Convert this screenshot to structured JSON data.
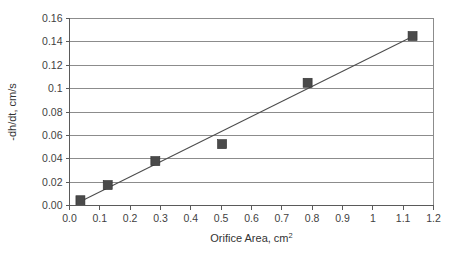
{
  "chart_data": {
    "type": "scatter",
    "title": "",
    "xlabel": "Orifice Area, cm",
    "xlabel_superscript": "2",
    "ylabel": "-dh/dt, cm/s",
    "xlim": [
      0.0,
      1.2
    ],
    "ylim": [
      0.0,
      0.16
    ],
    "grid": "horizontal",
    "legend": "none",
    "x_tick_labels": [
      "0.0",
      "0.1",
      "0.2",
      "0.3",
      "0.4",
      "0.5",
      "0.6",
      "0.7",
      "0.8",
      "0.9",
      "1",
      "1.1",
      "1.2"
    ],
    "x_tick_values": [
      0.0,
      0.1,
      0.2,
      0.3,
      0.4,
      0.5,
      0.6,
      0.7,
      0.8,
      0.9,
      1.0,
      1.1,
      1.2
    ],
    "y_tick_labels": [
      "0.00",
      "0.02",
      "0.04",
      "0.06",
      "0.08",
      "0.1",
      "0.12",
      "0.14",
      "0.16"
    ],
    "y_tick_values": [
      0.0,
      0.02,
      0.04,
      0.06,
      0.08,
      0.1,
      0.12,
      0.14,
      0.16
    ],
    "series": [
      {
        "name": "Orifice discharge data",
        "marker": "square",
        "marker_color": "#4a4a4a",
        "points": [
          {
            "x": 0.036,
            "y": 0.0045
          },
          {
            "x": 0.126,
            "y": 0.0175
          },
          {
            "x": 0.283,
            "y": 0.038
          },
          {
            "x": 0.503,
            "y": 0.0525
          },
          {
            "x": 0.785,
            "y": 0.105
          },
          {
            "x": 1.131,
            "y": 0.145
          }
        ]
      }
    ],
    "trendline": {
      "name": "linear-fit",
      "color": "#4d4d4d",
      "x_start": 0.036,
      "y_start": 0.0035,
      "x_end": 1.131,
      "y_end": 0.1445
    },
    "marker_size_px": 9
  }
}
